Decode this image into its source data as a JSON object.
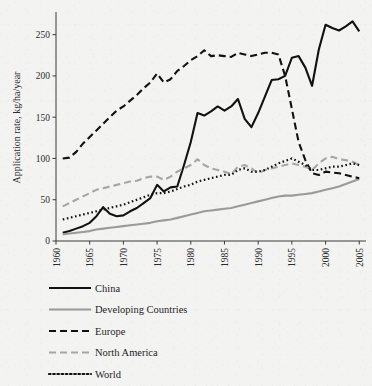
{
  "figure": {
    "background_color": "#f3f3f2",
    "plot_area": {
      "left": 56,
      "top": 14,
      "right": 366,
      "bottom": 241
    }
  },
  "chart_data": {
    "type": "line",
    "title": "",
    "xlabel": "",
    "ylabel": "Application rate, kg/ha/year",
    "xlim": [
      1960,
      2006
    ],
    "ylim": [
      0,
      275
    ],
    "xticks": [
      1960,
      1965,
      1970,
      1975,
      1980,
      1985,
      1990,
      1995,
      2000,
      2005
    ],
    "xtick_labels": [
      "1960",
      "1965",
      "1970",
      "1975",
      "1980",
      "1985",
      "1990",
      "1995",
      "2000",
      "2005"
    ],
    "yticks": [
      0,
      50,
      100,
      150,
      200,
      250
    ],
    "ytick_labels": [
      "0",
      "50",
      "100",
      "150",
      "200",
      "250"
    ],
    "grid": false,
    "legend_position": "below",
    "x": [
      1961,
      1962,
      1963,
      1964,
      1965,
      1966,
      1967,
      1968,
      1969,
      1970,
      1971,
      1972,
      1973,
      1974,
      1975,
      1976,
      1977,
      1978,
      1979,
      1980,
      1981,
      1982,
      1983,
      1984,
      1985,
      1986,
      1987,
      1988,
      1989,
      1990,
      1991,
      1992,
      1993,
      1994,
      1995,
      1996,
      1997,
      1998,
      1999,
      2000,
      2001,
      2002,
      2003,
      2004,
      2005
    ],
    "series": [
      {
        "name": "China",
        "style": "solid",
        "color": "#111111",
        "width": 2.1,
        "values": [
          10,
          12,
          15,
          18,
          22,
          30,
          41,
          33,
          30,
          31,
          36,
          40,
          46,
          52,
          68,
          60,
          65,
          66,
          92,
          120,
          155,
          152,
          157,
          163,
          158,
          163,
          172,
          148,
          138,
          155,
          175,
          195,
          196,
          200,
          222,
          224,
          210,
          188,
          232,
          262,
          258,
          255,
          260,
          266,
          254
        ]
      },
      {
        "name": "Developing Countries",
        "style": "solid",
        "color": "#9a9a9a",
        "width": 2.1,
        "values": [
          8,
          9,
          10,
          11,
          12,
          14,
          15,
          16,
          17,
          18,
          19,
          20,
          21,
          22,
          24,
          25,
          26,
          28,
          30,
          32,
          34,
          36,
          37,
          38,
          39,
          40,
          42,
          44,
          46,
          48,
          50,
          52,
          54,
          55,
          55,
          56,
          57,
          58,
          60,
          62,
          64,
          66,
          69,
          72,
          75
        ]
      },
      {
        "name": "Europe",
        "style": "dashed",
        "color": "#111111",
        "width": 2.1,
        "values": [
          100,
          101,
          108,
          118,
          126,
          134,
          142,
          150,
          158,
          163,
          170,
          177,
          185,
          192,
          203,
          192,
          196,
          206,
          212,
          219,
          224,
          231,
          224,
          225,
          224,
          223,
          228,
          226,
          224,
          226,
          228,
          228,
          226,
          200,
          160,
          120,
          98,
          82,
          80,
          84,
          83,
          82,
          80,
          78,
          76
        ]
      },
      {
        "name": "North America",
        "style": "dashed",
        "color": "#a6a6a6",
        "width": 2.1,
        "values": [
          42,
          46,
          50,
          54,
          58,
          62,
          64,
          66,
          68,
          70,
          72,
          73,
          76,
          78,
          78,
          74,
          78,
          84,
          88,
          92,
          99,
          92,
          88,
          86,
          84,
          81,
          90,
          92,
          88,
          82,
          86,
          88,
          90,
          92,
          94,
          92,
          90,
          86,
          94,
          100,
          102,
          99,
          98,
          96,
          92
        ]
      },
      {
        "name": "World",
        "style": "dotted",
        "color": "#111111",
        "width": 2.2,
        "values": [
          26,
          28,
          30,
          32,
          34,
          36,
          38,
          40,
          42,
          44,
          47,
          50,
          53,
          56,
          58,
          58,
          60,
          63,
          66,
          68,
          72,
          74,
          76,
          78,
          80,
          80,
          86,
          88,
          84,
          84,
          86,
          90,
          94,
          97,
          100,
          96,
          92,
          86,
          86,
          88,
          90,
          90,
          92,
          94,
          92
        ]
      }
    ]
  },
  "legend": {
    "entries": [
      {
        "label": "China",
        "swatch": "solid-black"
      },
      {
        "label": "Developing Countries",
        "swatch": "solid-gray"
      },
      {
        "label": "Europe",
        "swatch": "dashed-black"
      },
      {
        "label": "North America",
        "swatch": "dashed-gray"
      },
      {
        "label": "World",
        "swatch": "dotted-black"
      }
    ]
  }
}
